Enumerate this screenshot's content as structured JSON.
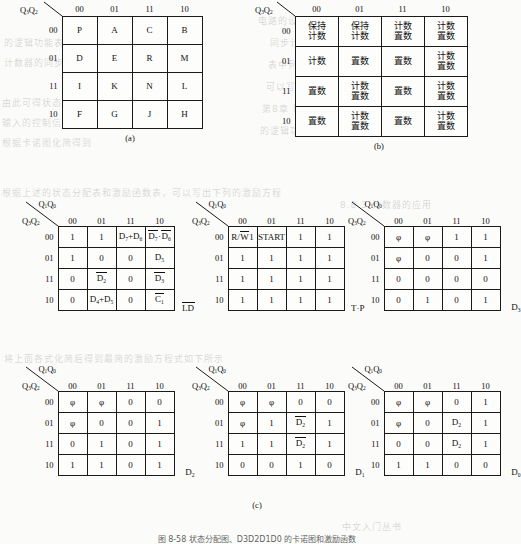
{
  "figure": {
    "caption": "图 8-58  状态分配图、D3D2D1D0 的卡诺图和激励函数",
    "subcaption_a": "(a)",
    "subcaption_b": "(b)",
    "subcaption_c": "(c)"
  },
  "axis": {
    "top_label": "Q1Q0",
    "left_label": "Q3Q2",
    "col_headers": [
      "00",
      "01",
      "11",
      "10"
    ],
    "row_headers": [
      "00",
      "01",
      "11",
      "10"
    ]
  },
  "table_a": {
    "name": "state-assignment-map",
    "top_label": "Q3Q2",
    "col_headers": [
      "00",
      "01",
      "11",
      "10"
    ],
    "row_headers": [
      "00",
      "01",
      "11",
      "10"
    ],
    "rows": [
      [
        "P",
        "A",
        "C",
        "B"
      ],
      [
        "D",
        "E",
        "R",
        "M"
      ],
      [
        "I",
        "K",
        "N",
        "L"
      ],
      [
        "F",
        "G",
        "J",
        "H"
      ]
    ]
  },
  "table_b": {
    "name": "counter-mode-map",
    "top_label": "Q3Q2",
    "col_headers": [
      "00",
      "01",
      "11",
      "10"
    ],
    "row_headers": [
      "00",
      "01",
      "11",
      "10"
    ],
    "rows": [
      [
        [
          "保持",
          "计数"
        ],
        [
          "保持",
          "计数"
        ],
        [
          "计数",
          "置数"
        ],
        [
          "计数",
          "置数"
        ]
      ],
      [
        [
          "计数"
        ],
        [
          "置数"
        ],
        [
          "置数"
        ],
        [
          "计数",
          "置数"
        ]
      ],
      [
        [
          "置数"
        ],
        [
          "计数",
          "置数"
        ],
        [
          "置数"
        ],
        [
          "计数",
          "置数"
        ]
      ],
      [
        [
          "置数"
        ],
        [
          "计数",
          "置数"
        ],
        [
          "置数"
        ],
        [
          "计数",
          "置数"
        ]
      ]
    ]
  },
  "kmaps": [
    {
      "name": "kmap-ld",
      "output_label": "LD",
      "output_overline": true,
      "rows": [
        [
          "1",
          "1",
          "D7+D6",
          "D7·D6"
        ],
        [
          "1",
          "0",
          "0",
          "D5"
        ],
        [
          "0",
          "D2",
          "0",
          "D3"
        ],
        [
          "0",
          "D4+D5",
          "0",
          "C1"
        ]
      ],
      "cells_html": [
        [
          "1",
          "1",
          "D<sub>7</sub>+D<sub>6</sub>",
          "<span class=\"ovl\">D<sub>7</sub></span>·<span class=\"ovl\">D<sub>6</sub></span>"
        ],
        [
          "1",
          "0",
          "0",
          "D<sub>5</sub>"
        ],
        [
          "0",
          "<span class=\"ovl\">D<sub>2</sub></span>",
          "0",
          "<span class=\"ovl\">D<sub>3</sub></span>"
        ],
        [
          "0",
          "D<sub>4</sub>+D<sub>5</sub>",
          "0",
          "<span class=\"ovl\">C<sub>1</sub></span>"
        ]
      ]
    },
    {
      "name": "kmap-tp",
      "output_label": "T·P",
      "output_overline": false,
      "rows": [
        [
          "R/W1",
          "START",
          "1",
          "1"
        ],
        [
          "1",
          "1",
          "1",
          "1"
        ],
        [
          "1",
          "1",
          "1",
          "1"
        ],
        [
          "1",
          "1",
          "1",
          "1"
        ]
      ],
      "cells_html": [
        [
          "R/<span class=\"ovl\">W</span>1",
          "START",
          "1",
          "1"
        ],
        [
          "1",
          "1",
          "1",
          "1"
        ],
        [
          "1",
          "1",
          "1",
          "1"
        ],
        [
          "1",
          "1",
          "1",
          "1"
        ]
      ]
    },
    {
      "name": "kmap-d3",
      "output_label": "D3",
      "output_overline": false,
      "rows": [
        [
          "φ",
          "φ",
          "1",
          "1"
        ],
        [
          "φ",
          "0",
          "0",
          "1"
        ],
        [
          "0",
          "0",
          "0",
          "0"
        ],
        [
          "0",
          "1",
          "0",
          "1"
        ]
      ],
      "cells_html": [
        [
          "φ",
          "φ",
          "1",
          "1"
        ],
        [
          "φ",
          "0",
          "0",
          "1"
        ],
        [
          "0",
          "0",
          "0",
          "0"
        ],
        [
          "0",
          "1",
          "0",
          "1"
        ]
      ]
    },
    {
      "name": "kmap-d2",
      "output_label": "D2",
      "output_overline": false,
      "rows": [
        [
          "φ",
          "φ",
          "0",
          "0"
        ],
        [
          "φ",
          "0",
          "0",
          "1"
        ],
        [
          "0",
          "1",
          "0",
          "1"
        ],
        [
          "1",
          "1",
          "0",
          "1"
        ]
      ],
      "cells_html": [
        [
          "φ",
          "φ",
          "0",
          "0"
        ],
        [
          "φ",
          "0",
          "0",
          "1"
        ],
        [
          "0",
          "1",
          "0",
          "1"
        ],
        [
          "1",
          "1",
          "0",
          "1"
        ]
      ]
    },
    {
      "name": "kmap-d1",
      "output_label": "D1",
      "output_overline": false,
      "rows": [
        [
          "φ",
          "φ",
          "0",
          "0"
        ],
        [
          "φ",
          "1",
          "D2",
          "1"
        ],
        [
          "1",
          "1",
          "D2",
          "1"
        ],
        [
          "0",
          "0",
          "1",
          "0"
        ]
      ],
      "cells_html": [
        [
          "φ",
          "φ",
          "0",
          "0"
        ],
        [
          "φ",
          "1",
          "<span class=\"ovl\">D<sub>2</sub></span>",
          "1"
        ],
        [
          "1",
          "1",
          "<span class=\"ovl\">D<sub>2</sub></span>",
          "1"
        ],
        [
          "0",
          "0",
          "1",
          "0"
        ]
      ]
    },
    {
      "name": "kmap-d0",
      "output_label": "D0",
      "output_overline": false,
      "rows": [
        [
          "φ",
          "φ",
          "0",
          "1"
        ],
        [
          "φ",
          "0",
          "D2",
          "1"
        ],
        [
          "0",
          "0",
          "D2",
          "1"
        ],
        [
          "1",
          "1",
          "0",
          "0"
        ]
      ],
      "cells_html": [
        [
          "φ",
          "φ",
          "0",
          "1"
        ],
        [
          "φ",
          "0",
          "D<sub>2</sub>",
          "1"
        ],
        [
          "0",
          "0",
          "D<sub>2</sub>",
          "1"
        ],
        [
          "1",
          "1",
          "0",
          "0"
        ]
      ]
    }
  ],
  "output_labels_html": {
    "kmap-ld": "<span class=\"ovl\">LD</span>",
    "kmap-tp": "T·P",
    "kmap-d3": "D<sub>3</sub>",
    "kmap-d2": "D<sub>2</sub>",
    "kmap-d1": "D<sub>1</sub>",
    "kmap-d0": "D<sub>0</sub>"
  },
  "axis_html": {
    "top": "Q<sub>1</sub>Q<sub>0</sub>",
    "left": "Q<sub>3</sub>Q<sub>2</sub>",
    "table_a_top": "Q<sub>3</sub>Q<sub>2</sub>"
  },
  "ghost_text": [
    "的逻辑功能表",
    "计数器的同步置数",
    "由此可得状态转移",
    "入的控制信号",
    "中文入门丛书",
    "表中列出的状态",
    "电路的设计方法",
    "第8章 时序逻辑",
    "根据卡诺图化简",
    "可以写出激励方程",
    "同步计数器的应用"
  ]
}
